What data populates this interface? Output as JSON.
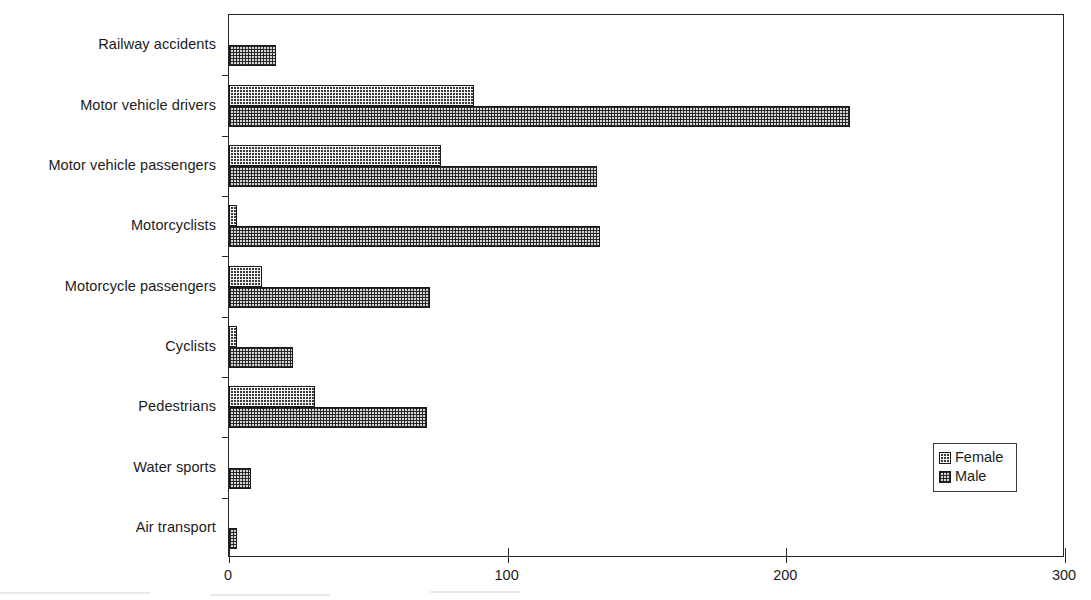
{
  "chart_data": {
    "type": "bar",
    "orientation": "horizontal",
    "title": "",
    "subtitle": "",
    "xlabel": "",
    "ylabel": "",
    "xlim": [
      0,
      300
    ],
    "xticks": [
      "0",
      "100",
      "200",
      "300"
    ],
    "xtick_values": [
      0,
      100,
      200,
      300
    ],
    "grid": false,
    "legend_position": "bottom-right",
    "categories": [
      "Railway accidents",
      "Motor vehicle drivers",
      "Motor vehicle passengers",
      "Motorcyclists",
      "Motorcycle passengers",
      "Cyclists",
      "Pedestrians",
      "Water sports",
      "Air transport"
    ],
    "series": [
      {
        "name": "Female",
        "values": [
          0,
          88,
          76,
          3,
          12,
          3,
          31,
          0,
          0
        ]
      },
      {
        "name": "Male",
        "values": [
          17,
          223,
          132,
          133,
          72,
          23,
          71,
          8,
          3
        ]
      }
    ]
  },
  "legend": {
    "items": [
      {
        "label": "Female",
        "pattern": "dark-checker"
      },
      {
        "label": "Male",
        "pattern": "light-checker"
      }
    ]
  },
  "colors": {
    "female_fill": "#3a3a3a",
    "male_fill": "#d6d6d6",
    "axis": "#262626",
    "text": "#1b1b1b",
    "background": "#ffffff"
  }
}
